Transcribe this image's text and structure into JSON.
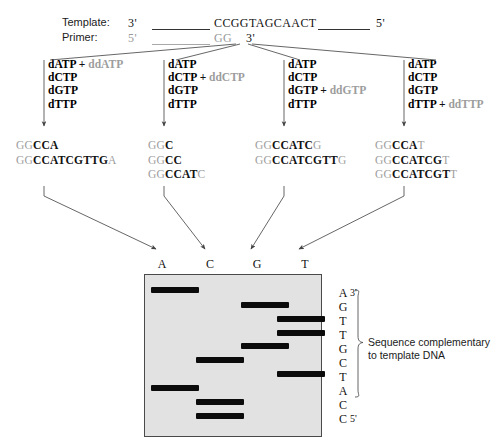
{
  "figure": {
    "title_hidden": "",
    "template_row": {
      "label": "Template:",
      "left_end": "3'",
      "sequence": "CCGGTAGCAACT",
      "right_end": "5'"
    },
    "primer_row": {
      "label": "Primer:",
      "left_end": "5'",
      "sequence": "GG",
      "right_end": "3'"
    }
  },
  "reactions": [
    {
      "id": "reaction-a",
      "lines": [
        {
          "base": "dATP",
          "plus": "+",
          "dd": "ddATP"
        },
        {
          "base": "dCTP",
          "plus": "",
          "dd": ""
        },
        {
          "base": "dGTP",
          "plus": "",
          "dd": ""
        },
        {
          "base": "dTTP",
          "plus": "",
          "dd": ""
        }
      ]
    },
    {
      "id": "reaction-c",
      "lines": [
        {
          "base": "dATP",
          "plus": "",
          "dd": ""
        },
        {
          "base": "dCTP",
          "plus": "+",
          "dd": "ddCTP"
        },
        {
          "base": "dGTP",
          "plus": "",
          "dd": ""
        },
        {
          "base": "dTTP",
          "plus": "",
          "dd": ""
        }
      ]
    },
    {
      "id": "reaction-g",
      "lines": [
        {
          "base": "dATP",
          "plus": "",
          "dd": ""
        },
        {
          "base": "dCTP",
          "plus": "",
          "dd": ""
        },
        {
          "base": "dGTP",
          "plus": "+",
          "dd": "ddGTP"
        },
        {
          "base": "dTTP",
          "plus": "",
          "dd": ""
        }
      ]
    },
    {
      "id": "reaction-t",
      "lines": [
        {
          "base": "dATP",
          "plus": "",
          "dd": ""
        },
        {
          "base": "dCTP",
          "plus": "",
          "dd": ""
        },
        {
          "base": "dGTP",
          "plus": "",
          "dd": ""
        },
        {
          "base": "dTTP",
          "plus": "+",
          "dd": "ddTTP"
        }
      ]
    }
  ],
  "products": [
    {
      "id": "products-a",
      "items": [
        {
          "prefix": "GG",
          "body": "CCA",
          "terminator": ""
        },
        {
          "prefix": "GG",
          "body": "CCATCGTTG",
          "terminator": "A"
        }
      ]
    },
    {
      "id": "products-c",
      "items": [
        {
          "prefix": "GG",
          "body": "C",
          "terminator": ""
        },
        {
          "prefix": "GG",
          "body": "CC",
          "terminator": ""
        },
        {
          "prefix": "GG",
          "body": "CCAT",
          "terminator": "C"
        }
      ]
    },
    {
      "id": "products-g",
      "items": [
        {
          "prefix": "GG",
          "body": "CCATC",
          "terminator": "G"
        },
        {
          "prefix": "GG",
          "body": "CCATCGTT",
          "terminator": "G"
        }
      ]
    },
    {
      "id": "products-t",
      "items": [
        {
          "prefix": "GG",
          "body": "CCA",
          "terminator": "T"
        },
        {
          "prefix": "GG",
          "body": "CCATCG",
          "terminator": "T"
        },
        {
          "prefix": "GG",
          "body": "CCATCGT",
          "terminator": "T"
        }
      ]
    }
  ],
  "gel": {
    "lane_labels": [
      "A",
      "C",
      "G",
      "T"
    ],
    "background_color": "#e2e2e2",
    "band_color": "#0b0b0b",
    "bands": [
      {
        "lane": "A",
        "rung": 1
      },
      {
        "lane": "G",
        "rung": 2
      },
      {
        "lane": "T",
        "rung": 3
      },
      {
        "lane": "T",
        "rung": 4
      },
      {
        "lane": "G",
        "rung": 5
      },
      {
        "lane": "C",
        "rung": 6
      },
      {
        "lane": "T",
        "rung": 7
      },
      {
        "lane": "A",
        "rung": 8
      },
      {
        "lane": "C",
        "rung": 9
      },
      {
        "lane": "C",
        "rung": 10
      }
    ]
  },
  "readout": {
    "letters": [
      "A",
      "G",
      "T",
      "T",
      "G",
      "C",
      "T",
      "A",
      "C",
      "C"
    ],
    "top_end": "3'",
    "bottom_end": "5'",
    "annotation_line1": "Sequence complementary",
    "annotation_line2": "to template DNA"
  }
}
